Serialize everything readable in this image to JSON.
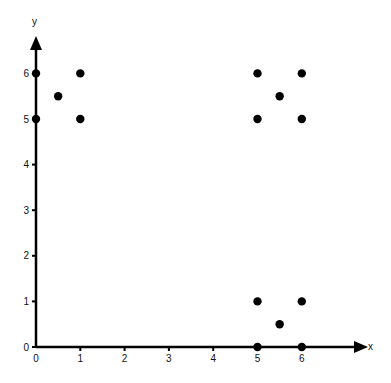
{
  "chart_data": {
    "type": "scatter",
    "title": "",
    "xlabel": "x",
    "ylabel": "y",
    "xlim": [
      0,
      7.2
    ],
    "ylim": [
      0,
      6.7
    ],
    "grid": false,
    "legend": null,
    "x_ticks": [
      0,
      1,
      2,
      3,
      4,
      5,
      6
    ],
    "y_ticks": [
      0,
      1,
      2,
      3,
      4,
      5,
      6
    ],
    "x_tick_labels": [
      "0",
      "1",
      "2",
      "3",
      "4",
      "5",
      "6"
    ],
    "y_tick_labels": [
      "0",
      "1",
      "2",
      "3",
      "4",
      "5",
      "6"
    ],
    "series": [
      {
        "name": "points",
        "color": "#000000",
        "points": [
          {
            "x": 0,
            "y": 6
          },
          {
            "x": 0,
            "y": 5
          },
          {
            "x": 0.5,
            "y": 5.5
          },
          {
            "x": 1,
            "y": 6
          },
          {
            "x": 1,
            "y": 5
          },
          {
            "x": 5,
            "y": 6
          },
          {
            "x": 6,
            "y": 6
          },
          {
            "x": 5.5,
            "y": 5.5
          },
          {
            "x": 5,
            "y": 5
          },
          {
            "x": 6,
            "y": 5
          },
          {
            "x": 5,
            "y": 1
          },
          {
            "x": 6,
            "y": 1
          },
          {
            "x": 5.5,
            "y": 0.5
          },
          {
            "x": 5,
            "y": 0
          },
          {
            "x": 6,
            "y": 0
          }
        ]
      }
    ]
  },
  "axes": {
    "x_label": "x",
    "y_label": "y",
    "origin_x_label": "0",
    "origin_y_label": "0"
  }
}
